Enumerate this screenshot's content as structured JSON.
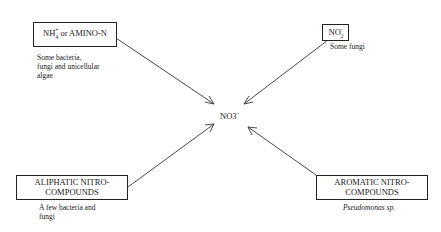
{
  "diagram": {
    "center": {
      "label": "NO3",
      "sub": "3",
      "sup": "-"
    },
    "nodes": [
      {
        "id": "ammonium",
        "label_main": "NH",
        "sub": "4",
        "sup": "+",
        "label_rest": " or AMINO-N",
        "note": "Some bacteria, fungi and unicellular algae",
        "note_lines": [
          "Some bacteria,",
          "fungi and unicellular",
          "algae"
        ]
      },
      {
        "id": "nitrite",
        "label_main": "NO",
        "sub": "2",
        "sup": "-",
        "note": "Some fungi"
      },
      {
        "id": "aliphatic",
        "label_lines": [
          "ALIPHATIC NITRO-",
          "COMPOUNDS"
        ],
        "note_lines": [
          "A few bacteria and",
          "fungi"
        ]
      },
      {
        "id": "aromatic",
        "label_lines": [
          "AROMATIC NITRO-",
          "COMPOUNDS"
        ],
        "note": "Pseudomonas sp."
      }
    ],
    "edges": [
      {
        "from": "ammonium",
        "to": "center"
      },
      {
        "from": "nitrite",
        "to": "center"
      },
      {
        "from": "aliphatic",
        "to": "center"
      },
      {
        "from": "aromatic",
        "to": "center"
      }
    ]
  }
}
